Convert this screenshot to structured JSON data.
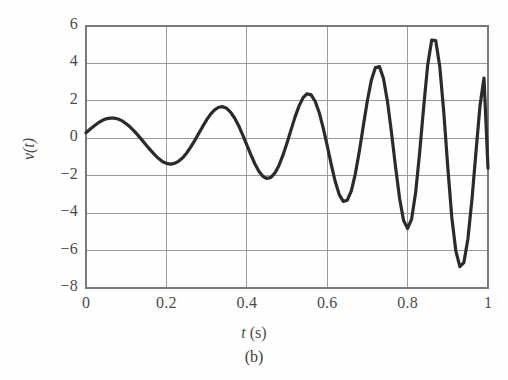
{
  "figure": {
    "caption": "(b)",
    "background_color": "#fefefe"
  },
  "axes": {
    "y_label": "v(t)",
    "y_label_var": "v",
    "y_label_arg": "(t)",
    "x_label_var": "t",
    "x_label_unit": "(s)",
    "x_label_full": "t (s)",
    "frame_color": "#7a7a7a",
    "grid_color": "#9a9a9a",
    "curve_color": "#2b2b2b"
  },
  "chart_data": {
    "type": "line",
    "title": "",
    "subtitle": "(b)",
    "xlabel": "t (s)",
    "ylabel": "v(t)",
    "xlim": [
      0,
      1
    ],
    "ylim": [
      -8,
      6
    ],
    "grid": true,
    "legend": "none",
    "xticks": [
      0,
      0.2,
      0.4,
      0.6,
      0.8,
      1
    ],
    "xtick_labels": [
      "0",
      "0.2",
      "0.4",
      "0.6",
      "0.8",
      "1"
    ],
    "yticks": [
      6,
      4,
      2,
      0,
      -2,
      -4,
      -6,
      -8
    ],
    "ytick_labels": [
      "6",
      "4",
      "2",
      "0",
      "−2",
      "−4",
      "−6",
      "−8"
    ],
    "series": [
      {
        "name": "v(t)",
        "color": "#2b2b2b",
        "line_width": 3.2,
        "x": [
          0.0,
          0.01,
          0.02,
          0.03,
          0.04,
          0.05,
          0.06,
          0.07,
          0.08,
          0.09,
          0.1,
          0.11,
          0.12,
          0.13,
          0.14,
          0.15,
          0.16,
          0.17,
          0.18,
          0.19,
          0.2,
          0.21,
          0.22,
          0.23,
          0.24,
          0.25,
          0.26,
          0.27,
          0.28,
          0.29,
          0.3,
          0.31,
          0.32,
          0.33,
          0.34,
          0.35,
          0.36,
          0.37,
          0.38,
          0.39,
          0.4,
          0.41,
          0.42,
          0.43,
          0.44,
          0.45,
          0.46,
          0.47,
          0.48,
          0.49,
          0.5,
          0.51,
          0.52,
          0.53,
          0.54,
          0.55,
          0.56,
          0.57,
          0.58,
          0.59,
          0.6,
          0.61,
          0.62,
          0.63,
          0.64,
          0.65,
          0.66,
          0.67,
          0.68,
          0.69,
          0.7,
          0.71,
          0.72,
          0.73,
          0.74,
          0.75,
          0.76,
          0.77,
          0.78,
          0.79,
          0.8,
          0.81,
          0.82,
          0.83,
          0.84,
          0.85,
          0.86,
          0.87,
          0.88,
          0.89,
          0.9,
          0.91,
          0.92,
          0.93,
          0.94,
          0.95,
          0.96,
          0.97,
          0.98,
          0.99,
          1.0
        ],
        "y": [
          0.3,
          0.48,
          0.66,
          0.82,
          0.95,
          1.04,
          1.08,
          1.08,
          1.03,
          0.93,
          0.78,
          0.6,
          0.38,
          0.14,
          -0.11,
          -0.37,
          -0.62,
          -0.86,
          -1.07,
          -1.24,
          -1.34,
          -1.38,
          -1.34,
          -1.23,
          -1.05,
          -0.8,
          -0.49,
          -0.14,
          0.24,
          0.62,
          0.98,
          1.29,
          1.52,
          1.66,
          1.69,
          1.6,
          1.39,
          1.07,
          0.66,
          0.17,
          -0.35,
          -0.87,
          -1.36,
          -1.76,
          -2.03,
          -2.15,
          -2.09,
          -1.85,
          -1.45,
          -0.9,
          -0.25,
          0.45,
          1.13,
          1.73,
          2.17,
          2.38,
          2.32,
          1.98,
          1.38,
          0.56,
          -0.39,
          -1.39,
          -2.31,
          -3.01,
          -3.37,
          -3.31,
          -2.81,
          -1.9,
          -0.69,
          0.68,
          2.02,
          3.12,
          3.78,
          3.83,
          3.2,
          1.96,
          0.29,
          -1.53,
          -3.2,
          -4.39,
          -4.82,
          -4.32,
          -2.9,
          -0.77,
          1.68,
          3.92,
          5.25,
          5.22,
          3.84,
          1.4,
          -1.56,
          -4.24,
          -6.02,
          -6.86,
          -6.64,
          -5.38,
          -3.29,
          -0.76,
          1.72,
          3.22,
          -1.6
        ]
      }
    ],
    "annotations": []
  },
  "yticks_display": [
    {
      "label": "6",
      "value": 6
    },
    {
      "label": "4",
      "value": 4
    },
    {
      "label": "2",
      "value": 2
    },
    {
      "label": "0",
      "value": 0
    },
    {
      "label": "−2",
      "value": -2
    },
    {
      "label": "−4",
      "value": -4
    },
    {
      "label": "−6",
      "value": -6
    },
    {
      "label": "−8",
      "value": -8
    }
  ],
  "xticks_display": [
    {
      "label": "0",
      "value": 0
    },
    {
      "label": "0.2",
      "value": 0.2
    },
    {
      "label": "0.4",
      "value": 0.4
    },
    {
      "label": "0.6",
      "value": 0.6
    },
    {
      "label": "0.8",
      "value": 0.8
    },
    {
      "label": "1",
      "value": 1
    }
  ]
}
